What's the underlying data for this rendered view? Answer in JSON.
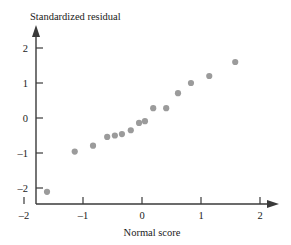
{
  "chart_data": {
    "type": "scatter",
    "title": "",
    "xlabel": "Normal score",
    "ylabel": "Standardized residual",
    "xlim": [
      -2.2,
      2.45
    ],
    "ylim": [
      -2.45,
      2.35
    ],
    "xticks": [
      -2,
      -1,
      0,
      1,
      2
    ],
    "xtick_labels": [
      "–2",
      "–1",
      "0",
      "1",
      "2"
    ],
    "yticks": [
      -2,
      -1,
      0,
      1,
      2
    ],
    "ytick_labels": [
      "–2",
      "–1",
      "0",
      "1",
      "2"
    ],
    "grid": false,
    "legend": null,
    "marker_color": "#9b9b9b",
    "axis_color": "#3a3a3a",
    "x": [
      -1.61,
      -1.14,
      -0.83,
      -0.59,
      -0.34,
      -0.19,
      -0.05,
      0.05,
      0.19,
      0.34,
      0.41,
      0.59,
      0.83,
      1.14,
      1.58
    ],
    "y": [
      -2.11,
      -0.96,
      -0.79,
      -0.54,
      -0.46,
      -0.35,
      -0.14,
      -0.09,
      0.28,
      0.29,
      0.71,
      0.71,
      1.0,
      1.2,
      1.6
    ],
    "points": [
      {
        "x": -1.61,
        "y": -2.11
      },
      {
        "x": -1.14,
        "y": -0.96
      },
      {
        "x": -0.83,
        "y": -0.79
      },
      {
        "x": -0.59,
        "y": -0.54
      },
      {
        "x": -0.34,
        "y": -0.46
      },
      {
        "x": -0.19,
        "y": -0.35
      },
      {
        "x": -0.05,
        "y": -0.14
      },
      {
        "x": 0.05,
        "y": -0.09
      },
      {
        "x": 0.19,
        "y": 0.28
      },
      {
        "x": 0.41,
        "y": 0.28
      },
      {
        "x": 0.61,
        "y": 0.71
      },
      {
        "x": 0.83,
        "y": 1.0
      },
      {
        "x": 1.14,
        "y": 1.2
      },
      {
        "x": 1.58,
        "y": 1.6
      },
      {
        "x": -0.46,
        "y": -0.5
      }
    ]
  }
}
